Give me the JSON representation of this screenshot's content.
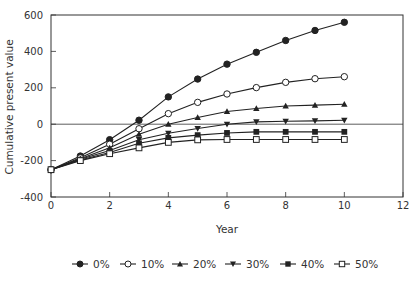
{
  "chart_data": {
    "type": "line",
    "title": "",
    "xlabel": "Year",
    "ylabel": "Cumulative present value",
    "xlim": [
      0,
      12
    ],
    "ylim": [
      -400,
      600
    ],
    "xticks": [
      0,
      2,
      4,
      6,
      8,
      10,
      12
    ],
    "yticks": [
      600,
      400,
      200,
      0,
      -200,
      -400
    ],
    "grid": false,
    "zero_line": true,
    "legend_position": "bottom",
    "x": [
      0,
      1,
      2,
      3,
      4,
      5,
      6,
      7,
      8,
      9,
      10
    ],
    "series": [
      {
        "name": "0%",
        "marker": "filled-circle",
        "values": [
          -250,
          -175,
          -85,
          22,
          150,
          248,
          330,
          395,
          460,
          515,
          560
        ]
      },
      {
        "name": "10%",
        "marker": "open-circle",
        "values": [
          -250,
          -185,
          -110,
          -25,
          58,
          120,
          166,
          201,
          230,
          250,
          261
        ]
      },
      {
        "name": "20%",
        "marker": "filled-triangle",
        "values": [
          -250,
          -190,
          -130,
          -55,
          0,
          37,
          70,
          86,
          100,
          105,
          110
        ]
      },
      {
        "name": "30%",
        "marker": "filled-down-triangle",
        "values": [
          -250,
          -193,
          -145,
          -85,
          -50,
          -24,
          0,
          13,
          16,
          18,
          22
        ]
      },
      {
        "name": "40%",
        "marker": "filled-square",
        "values": [
          -250,
          -197,
          -155,
          -105,
          -75,
          -60,
          -48,
          -42,
          -42,
          -42,
          -42
        ]
      },
      {
        "name": "50%",
        "marker": "open-square",
        "values": [
          -250,
          -200,
          -162,
          -130,
          -100,
          -86,
          -84,
          -84,
          -84,
          -84,
          -84
        ]
      }
    ]
  },
  "colors": {
    "line": "#222222",
    "axis": "#333333",
    "text": "#333333"
  }
}
